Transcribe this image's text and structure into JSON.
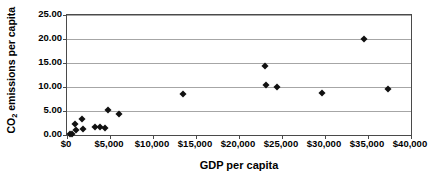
{
  "chart_data": {
    "type": "scatter",
    "title": "",
    "xlabel": "GDP per capita",
    "ylabel": "CO2 emissions per capita",
    "ylabel_prefix": "CO",
    "ylabel_sub": "2",
    "ylabel_suffix": " emissions per capita",
    "xlim": [
      0,
      40000
    ],
    "ylim": [
      0,
      25
    ],
    "grid": true,
    "legend": false,
    "marker": "diamond",
    "marker_color": "#111111",
    "gridline_color": "#a6a6a6",
    "frame_color": "#4a4a4a",
    "xticks": [
      0,
      5000,
      10000,
      15000,
      20000,
      25000,
      30000,
      35000,
      40000
    ],
    "xtick_labels": [
      "$0",
      "$5,000",
      "$10,000",
      "$15,000",
      "$20,000",
      "$25,000",
      "$30,000",
      "$35,000",
      "$40,000"
    ],
    "yticks": [
      0,
      5,
      10,
      15,
      20,
      25
    ],
    "ytick_labels": [
      "0.00",
      "5.00",
      "10.00",
      "15.00",
      "20.00",
      "25.00"
    ],
    "points": [
      {
        "x": 300,
        "y": 0.15
      },
      {
        "x": 600,
        "y": 0.3
      },
      {
        "x": 900,
        "y": 2.25
      },
      {
        "x": 1000,
        "y": 1.0
      },
      {
        "x": 1750,
        "y": 3.4
      },
      {
        "x": 1900,
        "y": 1.2
      },
      {
        "x": 3300,
        "y": 1.75
      },
      {
        "x": 3800,
        "y": 1.6
      },
      {
        "x": 4400,
        "y": 1.45
      },
      {
        "x": 4800,
        "y": 5.3
      },
      {
        "x": 6000,
        "y": 4.35
      },
      {
        "x": 13500,
        "y": 8.55
      },
      {
        "x": 23000,
        "y": 14.4
      },
      {
        "x": 23100,
        "y": 10.4
      },
      {
        "x": 24400,
        "y": 9.9
      },
      {
        "x": 29600,
        "y": 8.65
      },
      {
        "x": 34500,
        "y": 19.95
      },
      {
        "x": 37300,
        "y": 9.65
      }
    ]
  }
}
